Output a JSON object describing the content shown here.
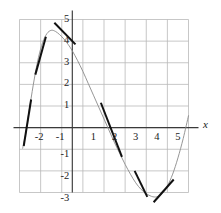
{
  "figure": {
    "title": "",
    "background": "#ffffff",
    "width": 221,
    "height": 213
  },
  "axis": {
    "x_variable_label": "x",
    "y_variable_label": "",
    "x_tick_labels": [
      "-2",
      "-1",
      "1",
      "2",
      "3",
      "4",
      "5"
    ],
    "y_tick_labels": [
      "5",
      "4",
      "3",
      "2",
      "1",
      "-1",
      "-2",
      "-3"
    ],
    "axis_color": "#3a3a3a",
    "grid_color": "#b9b9b9",
    "grid_visible": true
  },
  "chart_data": {
    "type": "line",
    "title": "",
    "xlabel": "x",
    "ylabel": "",
    "xlim": [
      -2.5,
      5.8
    ],
    "ylim": [
      -3.5,
      5.2
    ],
    "xticks": [
      -2,
      -1,
      1,
      2,
      3,
      4,
      5
    ],
    "yticks": [
      5,
      4,
      3,
      2,
      1,
      -1,
      -2,
      -3
    ],
    "grid": true,
    "legend": "none",
    "curve_color": "#8a8a8a",
    "tangent_color": "#111111",
    "series": [
      {
        "name": "curve",
        "comment": "smooth sinusoid-like curve, zero crossings near x=-2.2 and x=2.25, maximum ~4.5 near x=-1.0, minimum ~-3.2 near x=4.0",
        "x": [
          -2.35,
          -2.2,
          -2.0,
          -1.8,
          -1.6,
          -1.4,
          -1.2,
          -1.0,
          -0.8,
          -0.6,
          -0.4,
          -0.2,
          0.0,
          0.25,
          0.5,
          0.75,
          1.0,
          1.25,
          1.5,
          1.75,
          2.0,
          2.25,
          2.5,
          2.75,
          3.0,
          3.25,
          3.5,
          3.75,
          4.0,
          4.25,
          4.5,
          4.75,
          5.0,
          5.25,
          5.5
        ],
        "y": [
          -0.95,
          -0.25,
          1.05,
          2.25,
          3.25,
          3.95,
          4.35,
          4.5,
          4.45,
          4.3,
          4.1,
          3.85,
          3.55,
          3.1,
          2.6,
          2.05,
          1.5,
          0.95,
          0.4,
          -0.15,
          -0.7,
          -1.2,
          -1.7,
          -2.15,
          -2.55,
          -2.85,
          -3.05,
          -3.18,
          -3.2,
          -3.05,
          -2.7,
          -2.15,
          -1.4,
          -0.5,
          0.55
        ]
      }
    ],
    "tangent_segments": [
      {
        "name": "tangent-at-x-minus-2-1",
        "x0": -2.3,
        "y0": -0.85,
        "x1": -1.95,
        "y1": 1.3,
        "point_x": -2.15,
        "point_y": 0.2
      },
      {
        "name": "tangent-at-x-minus-1-6",
        "x0": -1.75,
        "y0": 2.45,
        "x1": -1.25,
        "y1": 4.2,
        "point_x": -1.5,
        "point_y": 3.35
      },
      {
        "name": "tangent-at-peak",
        "x0": -0.85,
        "y0": 4.85,
        "x1": 0.15,
        "y1": 3.85,
        "point_x": -0.35,
        "point_y": 4.35
      },
      {
        "name": "tangent-at-x-1-9",
        "x0": 1.35,
        "y0": 1.15,
        "x1": 2.35,
        "y1": -1.35,
        "point_x": 1.85,
        "point_y": -0.1
      },
      {
        "name": "tangent-at-x-3-2",
        "x0": 2.95,
        "y0": -2.0,
        "x1": 3.55,
        "y1": -3.2,
        "point_x": 3.25,
        "point_y": -2.6
      },
      {
        "name": "tangent-at-x-4-5",
        "x0": 3.85,
        "y0": -3.45,
        "x1": 4.8,
        "y1": -2.4,
        "point_x": 4.35,
        "point_y": -2.9
      }
    ]
  }
}
